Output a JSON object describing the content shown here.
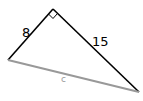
{
  "diagram": {
    "type": "right-triangle",
    "sides": {
      "leg_left": "8",
      "leg_right": "15",
      "hypotenuse": "c"
    },
    "right_angle_at": "top vertex",
    "colors": {
      "legs": "#000000",
      "hypotenuse": "#999999",
      "hyp_label": "#999999"
    }
  }
}
